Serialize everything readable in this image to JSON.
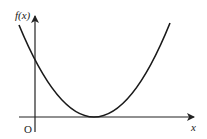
{
  "diagram": {
    "type": "function-graph",
    "y_axis_label": "f(x)",
    "x_axis_label": "x",
    "origin_label": "O",
    "curve": {
      "shape": "parabola",
      "description": "Upward-opening parabola touching the x-axis at a single positive x value (double root), positive y-intercept",
      "color": "#1a1a1a"
    },
    "colors": {
      "axes": "#222222",
      "background": "#ffffff"
    }
  }
}
